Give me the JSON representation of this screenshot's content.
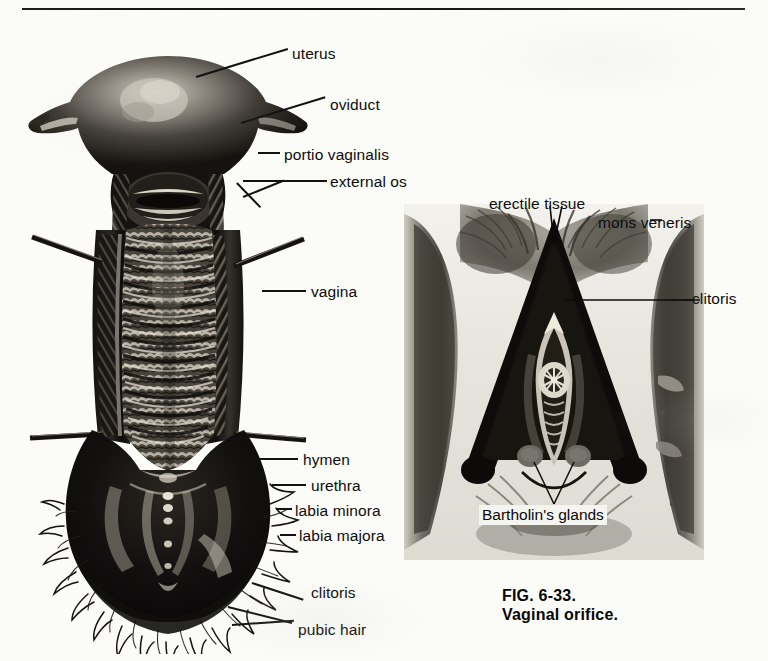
{
  "page": {
    "background_color": "#fbfbf8",
    "ink_color": "#111111",
    "top_rule": "horizontal-rule"
  },
  "figure_left": {
    "name": "uterus-vagina-external-genitalia-specimen",
    "type": "halftone-anatomical-photograph",
    "labels": [
      {
        "id": "uterus",
        "text": "uterus",
        "x": 292,
        "y": 46,
        "leader": "from-label-left-down-to-uterine-fundus"
      },
      {
        "id": "oviduct",
        "text": "oviduct",
        "x": 330,
        "y": 97,
        "leader": "from-label-left-down-to-left-oviduct"
      },
      {
        "id": "portio-vaginalis",
        "text": "portio vaginalis",
        "x": 284,
        "y": 147,
        "leader": "short-tick-to-cervix"
      },
      {
        "id": "external-os",
        "text": "external os",
        "x": 330,
        "y": 174,
        "leader": "long-horizontal-to-cervical-opening"
      },
      {
        "id": "vagina",
        "text": "vagina",
        "x": 311,
        "y": 284,
        "leader": "horizontal-to-vaginal-wall"
      },
      {
        "id": "hymen",
        "text": "hymen",
        "x": 303,
        "y": 452,
        "leader": "horizontal-to-hymen-margin"
      },
      {
        "id": "urethra",
        "text": "urethra",
        "x": 311,
        "y": 478,
        "leader": "horizontal-to-urethral-orifice"
      },
      {
        "id": "labia-minora",
        "text": "labia minora",
        "x": 295,
        "y": 503,
        "leader": "horizontal-to-labium-minus"
      },
      {
        "id": "labia-majora",
        "text": "labia majora",
        "x": 299,
        "y": 528,
        "leader": "horizontal-to-labium-majus"
      },
      {
        "id": "clitoris",
        "text": "clitoris",
        "x": 311,
        "y": 591,
        "leader": "diagonal-up-left-to-clitoris"
      },
      {
        "id": "pubic-hair",
        "text": "pubic hair",
        "x": 298,
        "y": 628,
        "leader": "two-diagonal-leaders-to-hair-margin"
      }
    ],
    "features": {
      "fundus": "uterine fundus with pale highlight",
      "oviducts": "paired horn-like oviducts at top corners",
      "cervix": "portio vaginalis with transverse external os",
      "vaginal_canal": "longitudinally opened canal showing transverse rugae",
      "retractors": "four retractor rods entering from left and right walls",
      "vestibule": "dark vestibule with labia and hymenal ring",
      "hair": "dense pubic hair fringe around lower margin"
    }
  },
  "figure_right": {
    "name": "vaginal-orifice-photograph",
    "type": "halftone-photograph",
    "frame": {
      "x": 404,
      "y": 204,
      "w": 300,
      "h": 356
    },
    "labels": [
      {
        "id": "erectile-tissue",
        "text": "erectile tissue",
        "x": 489,
        "y": 198,
        "leader": "two-lines-down-to-crura"
      },
      {
        "id": "mons-veneris",
        "text": "mons veneris",
        "x": 598,
        "y": 217,
        "leader": "tick-to-mons"
      },
      {
        "id": "clitoris-right",
        "text": "clitoris",
        "x": 692,
        "y": 298,
        "leader": "long-horizontal-left-to-clitoris"
      },
      {
        "id": "bartholins-glands",
        "text": "Bartholin's glands",
        "x": 481,
        "y": 510,
        "leader": "v-shaped-leader-up-to-paired-glands"
      }
    ],
    "features": {
      "triangle": "dark inverted-V of erectile tissue / crura",
      "orifice": "central vaginal orifice with hymenal folds",
      "glands": "paired grey Bartholin's gland markers",
      "thighs": "dark shaded thighs at left and right"
    }
  },
  "caption": {
    "figure_number": "FIG. 6-33.",
    "title": "Vaginal orifice.",
    "x": 502,
    "y": 588
  }
}
